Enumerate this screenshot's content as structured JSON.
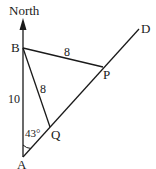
{
  "diagram": {
    "labels": {
      "north": "North",
      "A": "A",
      "B": "B",
      "P": "P",
      "Q": "Q",
      "D": "D",
      "AB_length": "10",
      "BP_length": "8",
      "BQ_length": "8",
      "angle_A": "43°"
    },
    "points": {
      "A": [
        23,
        157
      ],
      "B": [
        23,
        48
      ],
      "P": [
        103,
        67
      ],
      "Q": [
        50,
        127
      ],
      "D": [
        139,
        29
      ],
      "north_tip": [
        23,
        20
      ]
    },
    "colors": {
      "stroke": "#1a1a1a",
      "background": "#ffffff"
    }
  }
}
